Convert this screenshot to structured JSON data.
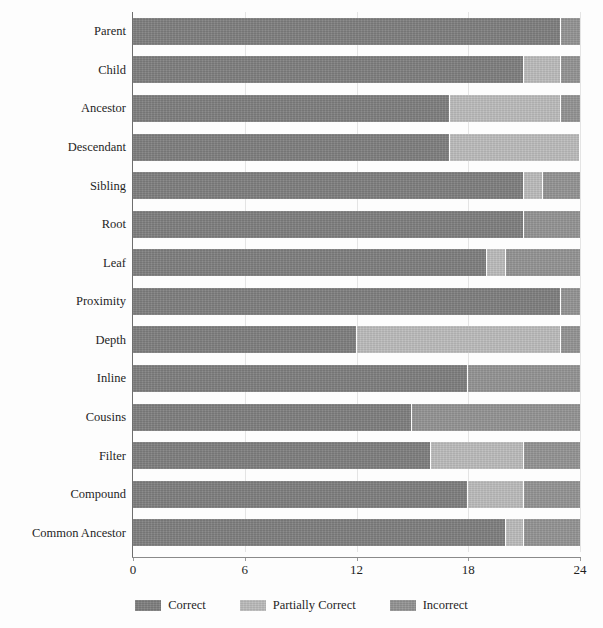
{
  "chart_data": {
    "type": "bar",
    "orientation": "horizontal",
    "stacked": true,
    "title": "",
    "subtitle": "",
    "xlabel": "",
    "ylabel": "",
    "xlim": [
      0,
      24
    ],
    "xticks": [
      0,
      6,
      12,
      18,
      24
    ],
    "xtick_labels": [
      "0",
      "6",
      "12",
      "18",
      "24"
    ],
    "grid": true,
    "grid_axis": "x",
    "legend_position": "bottom",
    "categories": [
      "Parent",
      "Child",
      "Ancestor",
      "Descendant",
      "Sibling",
      "Root",
      "Leaf",
      "Proximity",
      "Depth",
      "Inline",
      "Cousins",
      "Filter",
      "Compound",
      "Common Ancestor"
    ],
    "series": [
      {
        "name": "Correct",
        "color": "#7f7f7f",
        "values": [
          23,
          21,
          17,
          17,
          21,
          21,
          19,
          23,
          12,
          18,
          15,
          16,
          18,
          20
        ]
      },
      {
        "name": "Partially Correct",
        "color": "#bcbcbc",
        "values": [
          0,
          2,
          6,
          7,
          1,
          0,
          1,
          0,
          11,
          0,
          0,
          5,
          3,
          1
        ]
      },
      {
        "name": "Incorrect",
        "color": "#949494",
        "values": [
          1,
          1,
          1,
          0,
          2,
          3,
          4,
          1,
          1,
          6,
          9,
          3,
          3,
          3
        ]
      }
    ]
  },
  "legend": {
    "items": [
      {
        "label": "Correct",
        "color": "#7f7f7f",
        "swatch": "legend-swatch-correct"
      },
      {
        "label": "Partially Correct",
        "color": "#bcbcbc",
        "swatch": "legend-swatch-partially-correct"
      },
      {
        "label": "Incorrect",
        "color": "#949494",
        "swatch": "legend-swatch-incorrect"
      }
    ]
  }
}
